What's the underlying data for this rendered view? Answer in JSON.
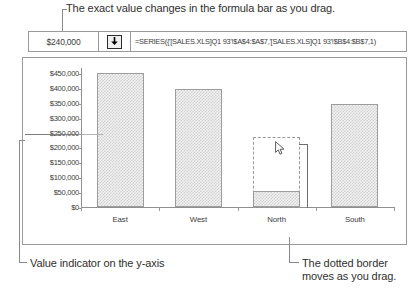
{
  "annotations": {
    "top": "The exact value changes in the formula bar as you drag.",
    "bottom_left": "Value indicator on the y-axis",
    "bottom_right": "The dotted border moves as you drag."
  },
  "formula_bar": {
    "value": "$240,000",
    "value_placeholder": "Value",
    "dropdown_icon": "down-arrow-icon",
    "formula": "=SERIES({'[SALES.XLS]Q1 93'!$A$4:$A$7,'[SALES.XLS]Q1 93'!$B$4:$B$7,1)",
    "formula_placeholder": "Enter formula"
  },
  "chart_data": {
    "type": "bar",
    "title": "",
    "xlabel": "",
    "ylabel": "",
    "categories": [
      "East",
      "West",
      "North",
      "South"
    ],
    "values": [
      450000,
      395000,
      55000,
      345000
    ],
    "ylim": [
      0,
      470000
    ],
    "ytick_values": [
      450000,
      400000,
      350000,
      300000,
      250000,
      200000,
      150000,
      100000,
      50000,
      0
    ],
    "ytick_labels": [
      "$450,000",
      "$400,000",
      "$350,000",
      "$300,000",
      "$250,000",
      "$200,000",
      "$150,000",
      "$100,000",
      "$50,000",
      "$0"
    ],
    "grid": false,
    "legend": "none",
    "series": [
      {
        "name": "Q1 93 Sales",
        "values": [
          450000,
          395000,
          55000,
          345000
        ]
      }
    ],
    "drag_target": {
      "category": "North",
      "dragged_to_value": 240000,
      "current_value": 55000,
      "indicator_label": "$250,000"
    },
    "colors": {
      "bar_fill": "#f2f2f2",
      "bar_pattern": "#cfcfcf",
      "bar_border": "#9d9d9d",
      "axis": "#8f8f8f",
      "drag_border": "#9a9a9a",
      "text": "#3c3c3c"
    }
  },
  "cursor": {
    "icon": "arrow-pointer-icon"
  }
}
